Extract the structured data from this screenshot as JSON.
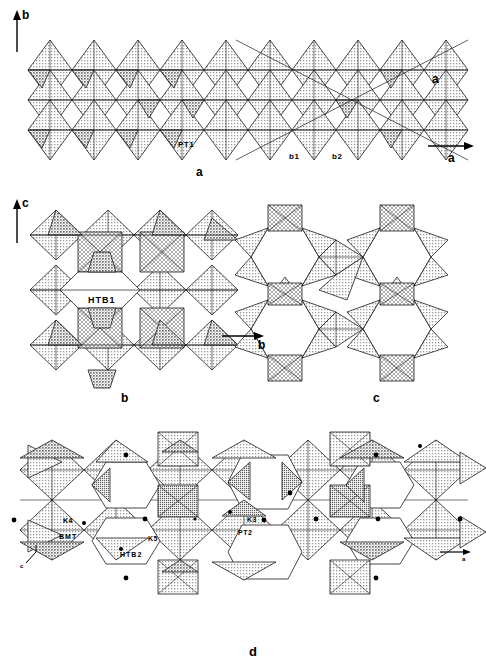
{
  "figure": {
    "type": "crystal-structure-polyhedral-diagram",
    "panels": [
      {
        "id": "a",
        "label": "a",
        "axes": [
          {
            "name": "b",
            "direction": "up"
          },
          {
            "name": "a",
            "direction": "right"
          }
        ],
        "floating_axis_label": "a",
        "site_labels": [
          "PT1",
          "b1",
          "b2"
        ],
        "description": "Slab of corner-sharing octahedra and tetrahedra projected along c"
      },
      {
        "id": "b",
        "label": "b",
        "axes": [
          {
            "name": "c",
            "direction": "up"
          },
          {
            "name": "b",
            "direction": "right"
          }
        ],
        "site_labels": [
          "HTB1"
        ],
        "description": "Hexagonal tungsten bronze type tunnel HTB1 in the a projection"
      },
      {
        "id": "c",
        "label": "c",
        "axes": [],
        "site_labels": [],
        "description": "Hexagonal tungsten bronze sheet of corner sharing octahedra"
      },
      {
        "id": "d",
        "label": "d",
        "axes": [
          {
            "name": "a",
            "direction": "right"
          },
          {
            "name": "c",
            "direction": "leader"
          }
        ],
        "site_labels": [
          "K4",
          "BMT",
          "K5",
          "HTB2",
          "K3",
          "PT2"
        ],
        "description": "Complex intergrowth showing pentagonal tunnels, HTB2 tunnels and cation sites marked by black dots"
      }
    ],
    "colors": {
      "background": "#ffffff",
      "outline": "#1a1a1a",
      "polyhedron_light": "#c9c9c9",
      "polyhedron_mid": "#a8a8a8",
      "polyhedron_dark": "#8a8a8a",
      "dot": "#000000"
    }
  },
  "panel_a": {
    "panel_label": "a",
    "axis_b": "b",
    "axis_a_arrow": "a",
    "axis_a_float": "a",
    "site_pt1": "PT1",
    "site_b1": "b1",
    "site_b2": "b2"
  },
  "panel_b": {
    "panel_label": "b",
    "axis_c": "c",
    "axis_b_arrow": "b",
    "site_htb1": "HTB1"
  },
  "panel_c": {
    "panel_label": "c"
  },
  "panel_d": {
    "panel_label": "d",
    "axis_a_arrow": "a",
    "axis_c": "c",
    "site_k4": "K4",
    "site_bmt": "BMT",
    "site_k5": "K5",
    "site_htb2": "HTB2",
    "site_k3": "K3",
    "site_pt2": "PT2"
  }
}
